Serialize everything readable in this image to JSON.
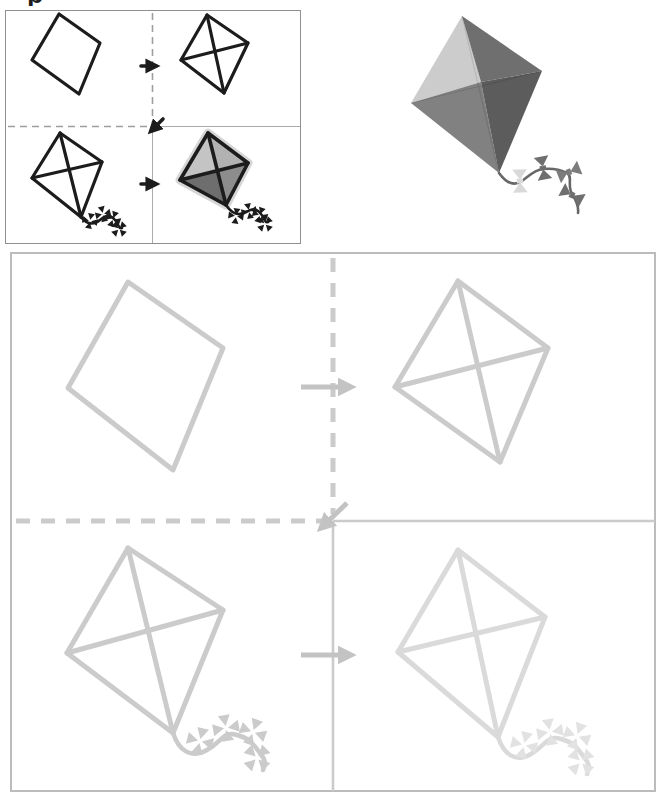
{
  "page": {
    "title_fragment": "p",
    "background": "#ffffff"
  },
  "colors": {
    "ink": "#1c1c1c",
    "example_border": "#8f8f8f",
    "example_dash": "#9e9e9e",
    "example_solid_divider": "#ababab",
    "practice_border": "#bcbcbc",
    "trace": "#cbcbcb",
    "trace_light": "#dadada",
    "trace_bow_light": "#e2e2e2",
    "arrow": "#c3c3c3",
    "kite_fill_top_left": "#cccccc",
    "kite_fill_top_right": "#6f6f6f",
    "kite_fill_bottom_left": "#818181",
    "kite_fill_bottom_right": "#5c5c5c",
    "kite_tail": "#676767",
    "kite_bow_light": "#d9d9d9",
    "kite_bow_dark": "#6f6f6f",
    "kite_bow_mid": "#7c7c7c",
    "crayon_top_left": "#c4c4c4",
    "crayon_top_right": "#b2b2b2",
    "crayon_bottom_left": "#6e6e6e",
    "crayon_bottom_right": "#8d8d8d",
    "crayon_halo": "#c0c0c0"
  },
  "figures": {
    "example_panel": {
      "steps": [
        "diamond-outline",
        "kite-with-crossbars",
        "kite-with-tail",
        "kite-colored-in"
      ]
    },
    "reference_kite": "shaded-kite-with-bow-tail",
    "practice_panel": {
      "steps": [
        "diamond-outline",
        "kite-with-crossbars",
        "kite-with-tail",
        "kite-with-tail-faint"
      ]
    }
  }
}
